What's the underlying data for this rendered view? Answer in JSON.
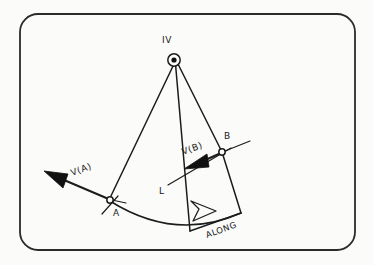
{
  "figure": {
    "background_color": "#fbfbfa",
    "ink_color": "#1c1c1c",
    "frame": {
      "name": "rounded-border-frame",
      "x": 20,
      "y": 14,
      "width": 335,
      "height": 236,
      "radius": 18
    },
    "labels": {
      "apex": "IV",
      "point_a": "A",
      "point_b": "B",
      "vector_a": "V(A)",
      "vector_b": "V(B)",
      "line_l": "L",
      "arc_direction": "ALONG"
    },
    "nodes": [
      {
        "name": "apex-iv",
        "label": "IV",
        "x": 174,
        "y": 60,
        "style": "circle-with-dot",
        "radius": 6.2,
        "dot_radius": 2.6
      },
      {
        "name": "point-a",
        "label": "A",
        "x": 110,
        "y": 200,
        "style": "open-circle",
        "radius": 3.2
      },
      {
        "name": "point-b",
        "label": "B",
        "x": 222,
        "y": 152,
        "style": "open-circle",
        "radius": 3.2
      }
    ],
    "vectors": [
      {
        "name": "velocity-vector-a",
        "label": "V(A)",
        "from_x": 110,
        "from_y": 200,
        "to_x": 46,
        "to_y": 172,
        "head": "solid"
      },
      {
        "name": "velocity-vector-b",
        "label": "V(B)",
        "from_x": 222,
        "from_y": 152,
        "to_x": 186,
        "to_y": 168,
        "head": "solid"
      },
      {
        "name": "along-direction-arrow",
        "label": "ALONG",
        "from_x": 188,
        "from_y": 228,
        "to_x": 215,
        "to_y": 212,
        "head": "hollow"
      }
    ],
    "rays": [
      {
        "name": "ray-iv-to-a",
        "from_x": 174,
        "from_y": 62,
        "to_x": 109,
        "to_y": 199
      },
      {
        "name": "ray-iv-to-arcbase",
        "from_x": 175,
        "from_y": 63,
        "to_x": 190,
        "to_y": 231
      },
      {
        "name": "ray-iv-to-b-extended",
        "from_x": 178,
        "from_y": 62,
        "to_x": 241,
        "to_y": 213
      }
    ],
    "arc": {
      "name": "swept-arc",
      "start_x": 110,
      "start_y": 201,
      "end_x": 241,
      "end_y": 213,
      "sag": 26
    }
  }
}
